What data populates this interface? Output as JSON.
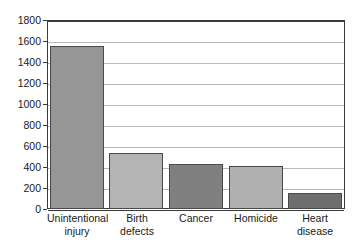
{
  "chart_data": {
    "type": "bar",
    "title": "",
    "subtitle": "",
    "xlabel": "",
    "ylabel": "",
    "categories": [
      "Unintentional injury",
      "Birth defects",
      "Cancer",
      "Homicide",
      "Heart disease"
    ],
    "category_lines": [
      [
        "Unintentional",
        "injury"
      ],
      [
        "Birth",
        "defects"
      ],
      [
        "Cancer",
        ""
      ],
      [
        "Homicide",
        ""
      ],
      [
        "Heart",
        "disease"
      ]
    ],
    "values": [
      1550,
      535,
      430,
      405,
      155
    ],
    "ylim": [
      0,
      1800
    ],
    "ytick_step": 200,
    "ytick_labels": [
      "1800",
      "1600",
      "1400",
      "1200",
      "1000",
      "800",
      "600",
      "400",
      "200",
      "0"
    ],
    "ytick_values": [
      1800,
      1600,
      1400,
      1200,
      1000,
      800,
      600,
      400,
      200,
      0
    ],
    "grid": true,
    "grid_axis": "y",
    "legend": "none",
    "bar_colors": [
      "#969696",
      "#b4b4b4",
      "#7f7f7f",
      "#b0b0b0",
      "#6e6e6e"
    ],
    "bar_border_color": "#4a4a4a",
    "axis_color": "#3a3a3a",
    "grid_color": "#b9b9b9",
    "plot_background": "#ffffff"
  }
}
